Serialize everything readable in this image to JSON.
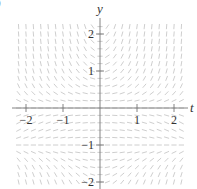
{
  "chart_data": {
    "type": "slope_field",
    "title": "",
    "equation": "dy/dt = t*y*(y+1)",
    "xlabel": "t",
    "ylabel": "y",
    "xlim": [
      -2.3,
      2.4
    ],
    "ylim": [
      -2.3,
      2.3
    ],
    "x_ticks": [
      -2,
      -1,
      1,
      2
    ],
    "x_tick_labels": [
      "−2",
      "−1",
      "1",
      "2"
    ],
    "y_ticks": [
      -2,
      -1,
      1,
      2
    ],
    "y_tick_labels": [
      "−2",
      "−1",
      "1",
      "2"
    ],
    "equilibria": [
      0,
      -1
    ],
    "grid_step": 0.2,
    "grid": false,
    "legend": null
  },
  "colors": {
    "axis": "#777777",
    "segment": "#c8c8c8",
    "text": "#333333"
  },
  "layout": {
    "origin_px": [
      100,
      108
    ],
    "unit_px": 37,
    "field_px_bounds": {
      "left": 14,
      "right": 188,
      "top": 22,
      "bottom": 189
    }
  },
  "corner_mark": ")"
}
